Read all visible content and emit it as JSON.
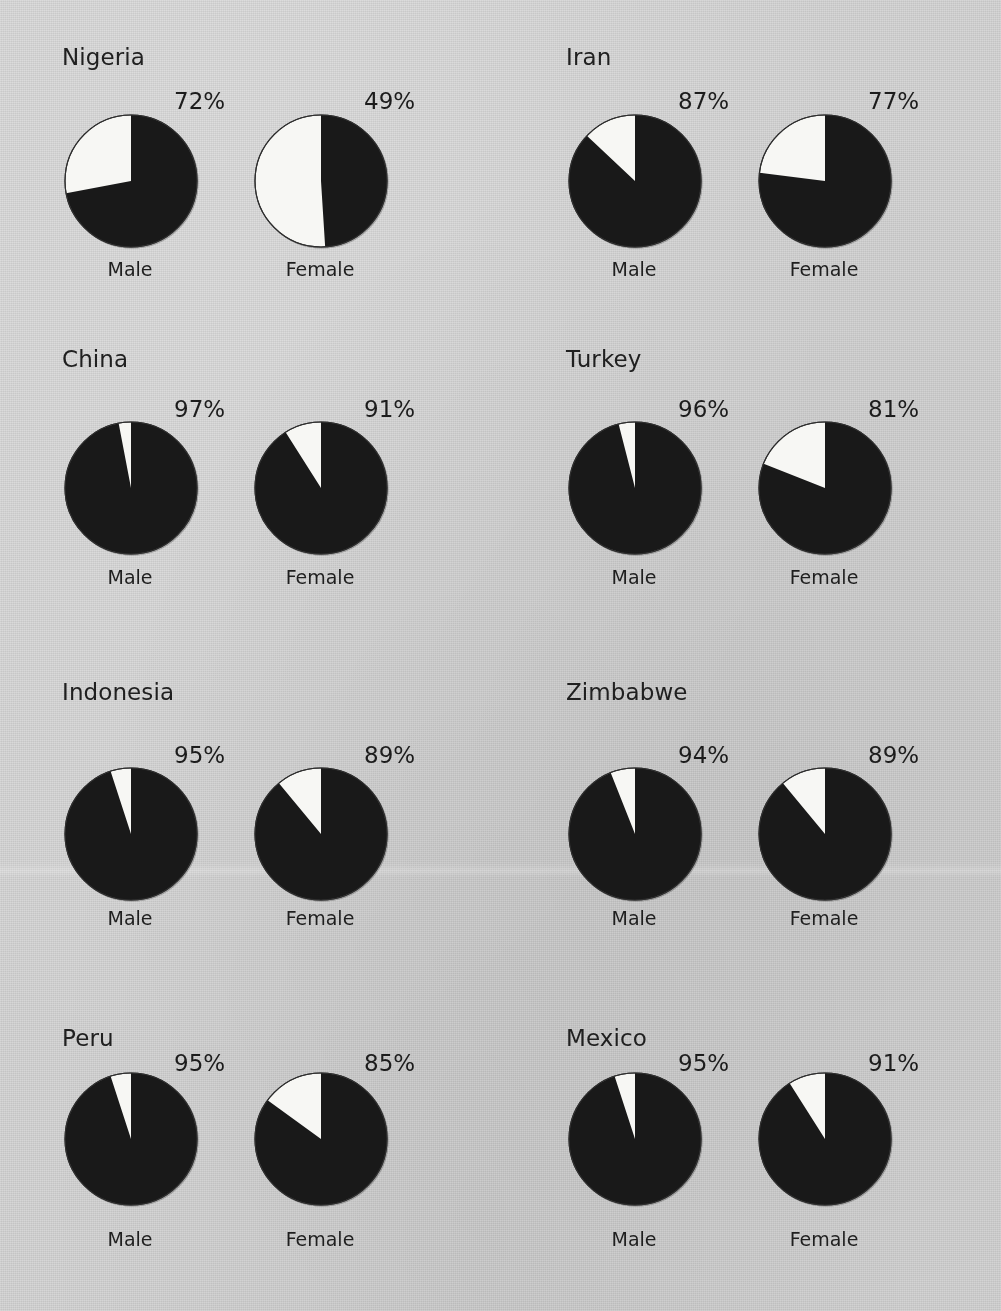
{
  "figure": {
    "background_color": "#d2d2d2",
    "slice_filled_color": "#191919",
    "slice_empty_color": "#f7f7f4",
    "sex_labels": {
      "male": "Male",
      "female": "Female"
    }
  },
  "chart_data": {
    "type": "pie",
    "title": "",
    "subtitle": "",
    "xlabel": "",
    "ylabel": "",
    "legend": [],
    "layout": {
      "rows": 4,
      "columns": 2,
      "pies_per_panel": 2,
      "start_angle_deg": 0,
      "direction": "clockwise"
    },
    "categories": [
      "Male",
      "Female"
    ],
    "value_unit": "%",
    "panels": [
      {
        "country": "Nigeria",
        "slices": [
          {
            "label": "Male",
            "value": 72,
            "value_text": "72%",
            "remainder": 28
          },
          {
            "label": "Female",
            "value": 49,
            "value_text": "49%",
            "remainder": 51
          }
        ]
      },
      {
        "country": "Iran",
        "slices": [
          {
            "label": "Male",
            "value": 87,
            "value_text": "87%",
            "remainder": 13
          },
          {
            "label": "Female",
            "value": 77,
            "value_text": "77%",
            "remainder": 23
          }
        ]
      },
      {
        "country": "China",
        "slices": [
          {
            "label": "Male",
            "value": 97,
            "value_text": "97%",
            "remainder": 3
          },
          {
            "label": "Female",
            "value": 91,
            "value_text": "91%",
            "remainder": 9
          }
        ]
      },
      {
        "country": "Turkey",
        "slices": [
          {
            "label": "Male",
            "value": 96,
            "value_text": "96%",
            "remainder": 4
          },
          {
            "label": "Female",
            "value": 81,
            "value_text": "81%",
            "remainder": 19
          }
        ]
      },
      {
        "country": "Indonesia",
        "slices": [
          {
            "label": "Male",
            "value": 95,
            "value_text": "95%",
            "remainder": 5
          },
          {
            "label": "Female",
            "value": 89,
            "value_text": "89%",
            "remainder": 11
          }
        ]
      },
      {
        "country": "Zimbabwe",
        "slices": [
          {
            "label": "Male",
            "value": 94,
            "value_text": "94%",
            "remainder": 6
          },
          {
            "label": "Female",
            "value": 89,
            "value_text": "89%",
            "remainder": 11
          }
        ]
      },
      {
        "country": "Peru",
        "slices": [
          {
            "label": "Male",
            "value": 95,
            "value_text": "95%",
            "remainder": 5
          },
          {
            "label": "Female",
            "value": 85,
            "value_text": "85%",
            "remainder": 15
          }
        ]
      },
      {
        "country": "Mexico",
        "slices": [
          {
            "label": "Male",
            "value": 95,
            "value_text": "95%",
            "remainder": 5
          },
          {
            "label": "Female",
            "value": 91,
            "value_text": "91%",
            "remainder": 9
          }
        ]
      }
    ]
  }
}
